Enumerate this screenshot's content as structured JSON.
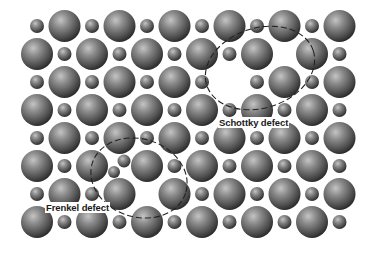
{
  "diagram": {
    "grid": {
      "rows": 8,
      "cols": 12,
      "origin_x": 37,
      "origin_y": 26,
      "step_x": 27.5,
      "step_y": 28,
      "large_radius": 16,
      "small_radius": 7,
      "rule": "large if (row+col) odd, small if even"
    },
    "vacancies": [
      {
        "row": 2,
        "col": 7,
        "type": "large",
        "defect": "Schottky"
      },
      {
        "row": 1,
        "col": 9,
        "type": "small",
        "defect": "Schottky"
      },
      {
        "row": 5,
        "col": 3,
        "type": "small",
        "defect": "Frenkel (displaced)"
      },
      {
        "row": 6,
        "col": 4,
        "type": "small",
        "defect": "Frenkel vacancy"
      }
    ],
    "extra_ions": [
      {
        "x": 124,
        "y": 161,
        "r": 6.5,
        "type": "small"
      },
      {
        "x": 114,
        "y": 172,
        "r": 6,
        "type": "small"
      }
    ],
    "regions": [
      {
        "name": "Schottky defect",
        "cx": 260,
        "cy": 68,
        "rx": 56,
        "ry": 40,
        "rotate": -18
      },
      {
        "name": "Frenkel defect",
        "cx": 139,
        "cy": 178,
        "rx": 49,
        "ry": 39,
        "rotate": 18
      }
    ],
    "colors": {
      "background": "#ffffff",
      "ion_light": "#b8b8b8",
      "ion_mid": "#6e6e6e",
      "ion_dark": "#2e2e2e",
      "dash": "#222222"
    }
  },
  "labels": {
    "frenkel": "Frenkel defect",
    "schottky": "Schottky defect"
  }
}
